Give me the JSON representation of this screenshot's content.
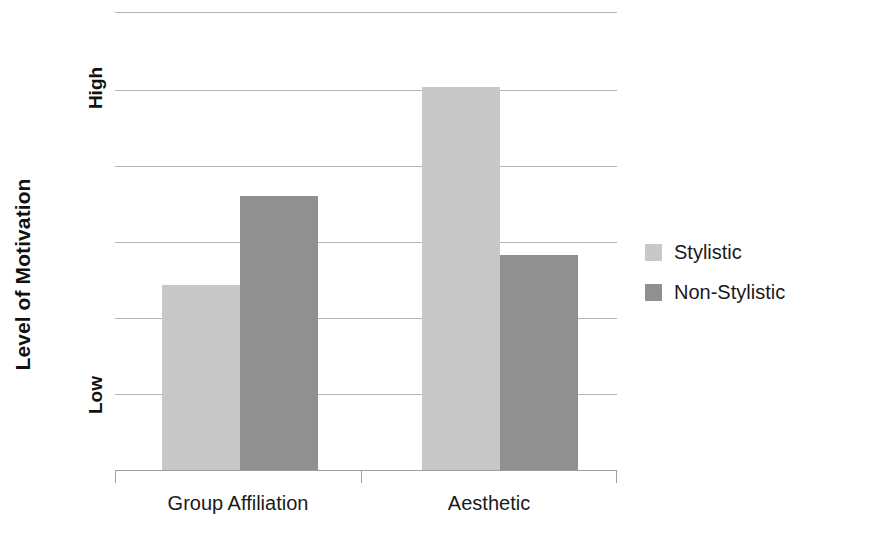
{
  "chart_data": {
    "type": "bar",
    "title": "",
    "xlabel": "",
    "ylabel": "Level of Motivation",
    "categories": [
      "Group Affiliation",
      "Aesthetic"
    ],
    "series": [
      {
        "name": "Stylistic",
        "color": "#c8c8c8",
        "values": [
          2.43,
          5.04
        ]
      },
      {
        "name": "Non-Stylistic",
        "color": "#909090",
        "values": [
          3.61,
          2.83
        ]
      }
    ],
    "ylim": [
      0,
      6.03
    ],
    "ytick_values": [
      1,
      5
    ],
    "ytick_labels": [
      "Low",
      "High"
    ],
    "gridlines": [
      0,
      1,
      2,
      3,
      4,
      5,
      6.03
    ],
    "grid": true,
    "legend_position": "right",
    "annotations": []
  },
  "axes": {
    "y_title": "Level of Motivation",
    "y_ticks": [
      {
        "label": "High",
        "value": 5
      },
      {
        "label": "Low",
        "value": 1
      }
    ],
    "x_categories": [
      {
        "label": "Group Affiliation"
      },
      {
        "label": "Aesthetic"
      }
    ]
  },
  "legend": {
    "entries": [
      {
        "label": "Stylistic",
        "color": "#c8c8c8"
      },
      {
        "label": "Non-Stylistic",
        "color": "#909090"
      }
    ]
  },
  "colors": {
    "series_light": "#c8c8c8",
    "series_dark": "#909090",
    "gridline": "#b4b4b4",
    "axis": "#a0a0a0",
    "text": "#1a1a1a",
    "background": "#ffffff"
  }
}
